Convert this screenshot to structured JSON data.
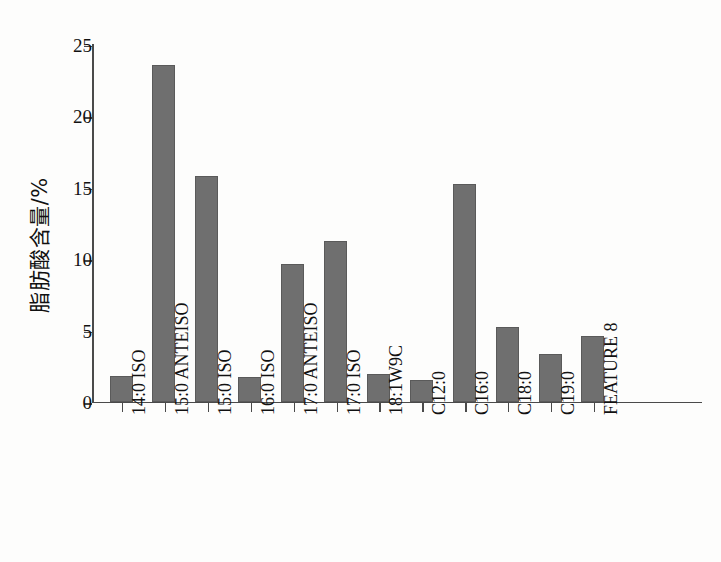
{
  "chart_data": {
    "type": "bar",
    "title": "",
    "xlabel": "",
    "ylabel": "脂肪酸含量/%",
    "ylim": [
      0,
      25
    ],
    "yticks": [
      0,
      5,
      10,
      15,
      20,
      25
    ],
    "ytick_labels": [
      "0",
      "5",
      "10",
      "15",
      "20",
      "25"
    ],
    "grid": false,
    "legend": false,
    "bar_color": "#6f6f6f",
    "axis_color": "#4a4a4a",
    "categories": [
      "14:0 ISO",
      "15:0 ANTEISO",
      "15:0 ISO",
      "16:0 ISO",
      "17:0 ANTEISO",
      "17:0 ISO",
      "18:1W9C",
      "C12:0",
      "C16:0",
      "C18:0",
      "C19:0",
      "FEATURE 8"
    ],
    "values": [
      1.8,
      23.5,
      15.8,
      1.7,
      9.6,
      11.2,
      1.9,
      1.5,
      15.2,
      5.2,
      3.3,
      4.6
    ]
  }
}
